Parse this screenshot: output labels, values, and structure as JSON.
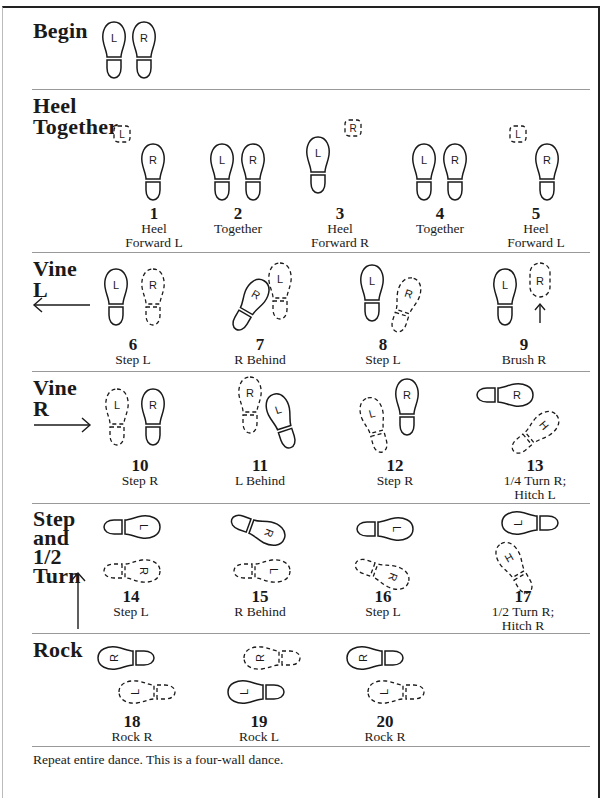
{
  "document": {
    "title_partial": "",
    "sections": [
      {
        "id": "begin",
        "title": "Begin",
        "steps": []
      },
      {
        "id": "heel-together",
        "title_lines": [
          "Heel",
          "Together"
        ],
        "steps": [
          {
            "num": "1",
            "label_lines": [
              "Heel",
              "Forward L"
            ]
          },
          {
            "num": "2",
            "label_lines": [
              "Together"
            ]
          },
          {
            "num": "3",
            "label_lines": [
              "Heel",
              "Forward R"
            ]
          },
          {
            "num": "4",
            "label_lines": [
              "Together"
            ]
          },
          {
            "num": "5",
            "label_lines": [
              "Heel",
              "Forward L"
            ]
          }
        ]
      },
      {
        "id": "vine-l",
        "title_lines": [
          "Vine",
          "L"
        ],
        "direction": "left",
        "steps": [
          {
            "num": "6",
            "label_lines": [
              "Step L"
            ]
          },
          {
            "num": "7",
            "label_lines": [
              "R Behind"
            ]
          },
          {
            "num": "8",
            "label_lines": [
              "Step L"
            ]
          },
          {
            "num": "9",
            "label_lines": [
              "Brush R"
            ]
          }
        ]
      },
      {
        "id": "vine-r",
        "title_lines": [
          "Vine",
          "R"
        ],
        "direction": "right",
        "steps": [
          {
            "num": "10",
            "label_lines": [
              "Step R"
            ]
          },
          {
            "num": "11",
            "label_lines": [
              "L Behind"
            ]
          },
          {
            "num": "12",
            "label_lines": [
              "Step R"
            ]
          },
          {
            "num": "13",
            "label_lines": [
              "1/4 Turn R;",
              "Hitch L"
            ]
          }
        ]
      },
      {
        "id": "step-half-turn",
        "title_lines": [
          "Step",
          "and",
          "1/2",
          "Turn"
        ],
        "direction": "up",
        "steps": [
          {
            "num": "14",
            "label_lines": [
              "Step L"
            ]
          },
          {
            "num": "15",
            "label_lines": [
              "R Behind"
            ]
          },
          {
            "num": "16",
            "label_lines": [
              "Step L"
            ]
          },
          {
            "num": "17",
            "label_lines": [
              "1/2 Turn R;",
              "Hitch R"
            ]
          }
        ]
      },
      {
        "id": "rock",
        "title": "Rock",
        "steps": [
          {
            "num": "18",
            "label_lines": [
              "Rock R"
            ]
          },
          {
            "num": "19",
            "label_lines": [
              "Rock L"
            ]
          },
          {
            "num": "20",
            "label_lines": [
              "Rock R"
            ]
          }
        ]
      }
    ],
    "foot_letters": {
      "left": "L",
      "right": "R"
    },
    "footer": "Repeat entire dance.  This is a four-wall dance."
  },
  "colors": {
    "ink": "#1a1a1a",
    "rule": "#999999",
    "frame": "#222222"
  }
}
